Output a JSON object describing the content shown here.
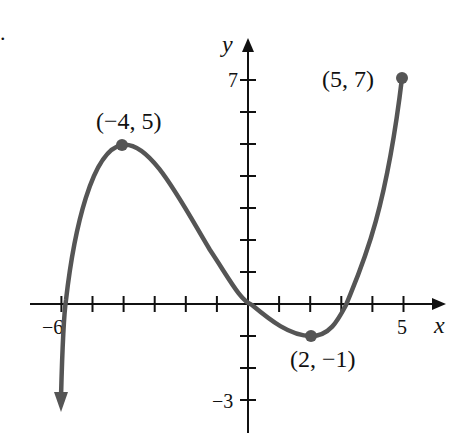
{
  "figure_marker": ".",
  "chart_data": {
    "type": "line",
    "title": "",
    "xlabel": "x",
    "ylabel": "y",
    "xlim": [
      -6.5,
      6
    ],
    "ylim": [
      -3.5,
      7.5
    ],
    "x_tick_labels": [
      "-6",
      "5"
    ],
    "y_tick_labels": [
      "7",
      "-3"
    ],
    "x_ticks": [
      -6,
      -5,
      -4,
      -3,
      -2,
      -1,
      1,
      2,
      3,
      4,
      5
    ],
    "y_ticks": [
      -3,
      -2,
      -1,
      1,
      2,
      3,
      4,
      5,
      6,
      7
    ],
    "grid": false,
    "series": [
      {
        "name": "f(x)",
        "x": [
          -6.1,
          -5.9,
          -5,
          -4,
          -3,
          -2,
          -1,
          0,
          1,
          2,
          3,
          3.2,
          4,
          5
        ],
        "y": [
          -3.2,
          0,
          4.0,
          5,
          4.3,
          2.9,
          1.4,
          0,
          -0.8,
          -1,
          -0.2,
          0,
          2.2,
          7
        ],
        "left_end": "arrow-down",
        "right_end": "closed-dot"
      }
    ],
    "annotations": [
      {
        "label": "(-4, 5)",
        "x": -4,
        "y": 5
      },
      {
        "label": "(2, -1)",
        "x": 2,
        "y": -1
      },
      {
        "label": "(5, 7)",
        "x": 5,
        "y": 7
      }
    ]
  }
}
